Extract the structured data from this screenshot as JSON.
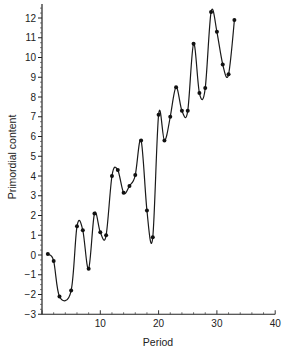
{
  "chart_data": {
    "type": "line",
    "title": "",
    "xlabel": "Period",
    "ylabel": "Primordial content",
    "xlim": [
      0,
      40
    ],
    "ylim": [
      -3,
      12.5
    ],
    "xticks": [
      10,
      20,
      30,
      40
    ],
    "xtick_labels": [
      "10",
      "20",
      "30",
      "40"
    ],
    "yticks": [
      -3,
      -2,
      -1,
      0,
      1,
      2,
      3,
      4,
      5,
      6,
      7,
      8,
      9,
      10,
      11,
      12
    ],
    "ytick_labels": [
      "−3",
      "−2",
      "−1",
      "0",
      "1",
      "2",
      "3",
      "4",
      "5",
      "6",
      "7",
      "8",
      "9",
      "10",
      "11",
      "12"
    ],
    "grid": false,
    "legend": null,
    "line_style": "smooth spline with filled circular markers",
    "series": [
      {
        "name": "Primordial content",
        "x": [
          1,
          2,
          3,
          5,
          6,
          7,
          8,
          9,
          10,
          11,
          12,
          13,
          14,
          15,
          16,
          17,
          18,
          19,
          20,
          21,
          22,
          23,
          24,
          25,
          26,
          27,
          28,
          29,
          30,
          31,
          32,
          33
        ],
        "values": [
          0.05,
          -0.3,
          -2.1,
          -1.8,
          1.45,
          1.25,
          -0.7,
          2.1,
          1.15,
          1.0,
          4.0,
          4.3,
          3.15,
          3.5,
          4.05,
          5.8,
          2.25,
          0.9,
          7.1,
          5.8,
          7.0,
          8.5,
          7.3,
          7.3,
          10.7,
          8.2,
          8.45,
          12.3,
          11.3,
          9.65,
          9.15,
          11.9
        ]
      }
    ]
  }
}
